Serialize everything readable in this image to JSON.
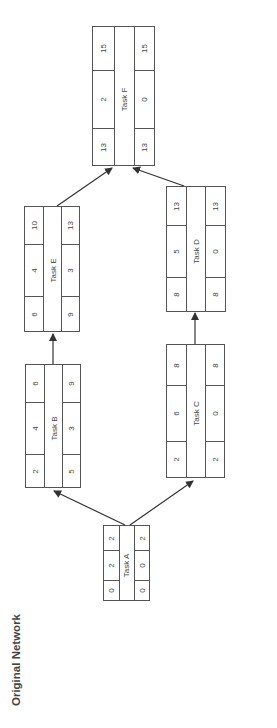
{
  "title": "Original Network",
  "nodes": {
    "A": {
      "name": "Task A",
      "es": "0",
      "dur": "2",
      "ef": "2",
      "ls": "0",
      "slack": "0",
      "lf": "2"
    },
    "B": {
      "name": "Task B",
      "es": "2",
      "dur": "4",
      "ef": "6",
      "ls": "5",
      "slack": "3",
      "lf": "9"
    },
    "C": {
      "name": "Task C",
      "es": "2",
      "dur": "6",
      "ef": "8",
      "ls": "2",
      "slack": "0",
      "lf": "8"
    },
    "D": {
      "name": "Task D",
      "es": "8",
      "dur": "5",
      "ef": "13",
      "ls": "8",
      "slack": "0",
      "lf": "13"
    },
    "E": {
      "name": "Task E",
      "es": "6",
      "dur": "4",
      "ef": "10",
      "ls": "9",
      "slack": "3",
      "lf": "13"
    },
    "F": {
      "name": "Task F",
      "es": "13",
      "dur": "2",
      "ef": "15",
      "ls": "13",
      "slack": "0",
      "lf": "15"
    }
  },
  "edges": [
    [
      "A",
      "B"
    ],
    [
      "A",
      "C"
    ],
    [
      "B",
      "E"
    ],
    [
      "C",
      "D"
    ],
    [
      "E",
      "F"
    ],
    [
      "D",
      "F"
    ]
  ]
}
